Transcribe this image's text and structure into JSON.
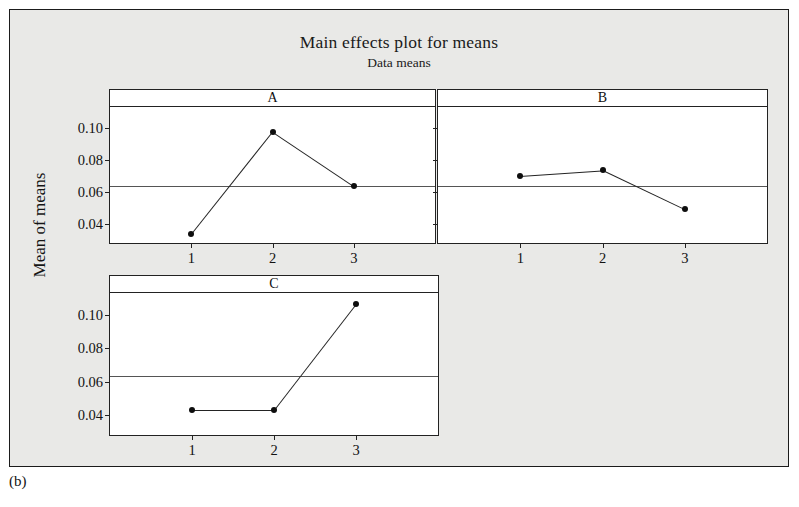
{
  "figure": {
    "title": "Main effects plot for means",
    "subtitle": "Data means",
    "ylabel": "Mean of means",
    "caption": "(b)",
    "background_color": "#e9e9e7",
    "panel_color": "#ffffff",
    "line_color": "#232323",
    "marker_color": "#0e0e0e"
  },
  "chart_data": {
    "type": "line",
    "title": "Main effects plot for means",
    "subtitle": "Data means",
    "xlabel": "",
    "ylabel": "Mean of means",
    "ylim": [
      0.028,
      0.113
    ],
    "yticks": [
      0.04,
      0.06,
      0.08,
      0.1
    ],
    "ytick_labels": [
      "0.04",
      "0.06",
      "0.08",
      "0.10"
    ],
    "xticks": [
      1,
      2,
      3
    ],
    "xtick_labels": [
      "1",
      "2",
      "3"
    ],
    "grid": false,
    "legend": "none",
    "reference_line": 0.0635,
    "panels": [
      {
        "name": "A",
        "categories": [
          "1",
          "2",
          "3"
        ],
        "values": [
          0.0335,
          0.0975,
          0.0635
        ]
      },
      {
        "name": "B",
        "categories": [
          "1",
          "2",
          "3"
        ],
        "values": [
          0.07,
          0.0735,
          0.049
        ]
      },
      {
        "name": "C",
        "categories": [
          "1",
          "2",
          "3"
        ],
        "values": [
          0.043,
          0.043,
          0.1065
        ]
      }
    ]
  }
}
